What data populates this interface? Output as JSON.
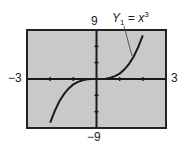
{
  "chart_data": {
    "type": "line",
    "title": "",
    "function_label": "Y1 = x^3",
    "label_main": "Y",
    "label_sub": "1",
    "label_eq": " = x",
    "label_sup": "3",
    "xlim": [
      -3,
      3
    ],
    "ylim": [
      -9,
      9
    ],
    "xmin_label": "−3",
    "xmax_label": "3",
    "ymin_label": "−9",
    "ymax_label": "9",
    "xscale": 1,
    "yscale": 3,
    "grid": false,
    "series": [
      {
        "name": "Y1 = x^3",
        "x": [
          -2.0,
          -1.8,
          -1.6,
          -1.4,
          -1.2,
          -1.0,
          -0.8,
          -0.6,
          -0.4,
          -0.2,
          0.0,
          0.2,
          0.4,
          0.6,
          0.8,
          1.0,
          1.2,
          1.4,
          1.6,
          1.8,
          2.0
        ],
        "values": [
          -8.0,
          -5.832,
          -4.096,
          -2.744,
          -1.728,
          -1.0,
          -0.512,
          -0.216,
          -0.064,
          -0.008,
          0.0,
          0.008,
          0.064,
          0.216,
          0.512,
          1.0,
          1.728,
          2.744,
          4.096,
          5.832,
          8.0
        ]
      }
    ]
  },
  "colors": {
    "plot_background": "#c9c9c9",
    "frame": "#222222",
    "curve": "#1a1a1a",
    "axis": "#1a1a1a"
  }
}
